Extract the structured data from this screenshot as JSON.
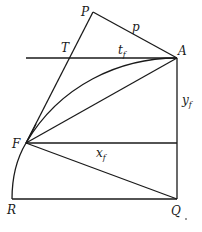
{
  "diagram": {
    "points": {
      "P": {
        "label": "P",
        "x": 93,
        "y": 12
      },
      "A": {
        "label": "A",
        "x": 177,
        "y": 58
      },
      "T": {
        "label": "T",
        "x": 69,
        "y": 58
      },
      "F": {
        "label": "F",
        "x": 26,
        "y": 143
      },
      "R": {
        "label": "R",
        "x": 12,
        "y": 199
      },
      "Q": {
        "label": "Q",
        "x": 177,
        "y": 199
      }
    },
    "segment_labels": {
      "p": {
        "base": "p",
        "sub": ""
      },
      "t_f": {
        "base": "t",
        "sub": "f"
      },
      "y_f": {
        "base": "y",
        "sub": "f"
      },
      "x_f": {
        "base": "x",
        "sub": "f"
      }
    },
    "stroke_color": "#1a1a1a",
    "background": "#ffffff"
  }
}
